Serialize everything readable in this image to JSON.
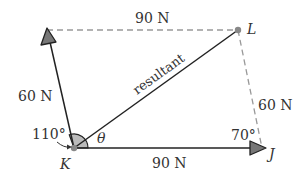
{
  "diagram": {
    "type": "vector-parallelogram",
    "points": {
      "K": "K",
      "L": "L",
      "J": "J"
    },
    "labels": {
      "top_force": "90 N",
      "left_force": "60 N",
      "right_force": "60 N",
      "bottom_force": "90 N",
      "resultant": "resultant",
      "angle_K": "110°",
      "angle_J": "70°",
      "theta": "θ"
    },
    "colors": {
      "line": "#222222",
      "dashed": "#999999",
      "arrowhead": "#777777",
      "angle_fill": "#bbbbbb",
      "point": "#888888"
    }
  }
}
